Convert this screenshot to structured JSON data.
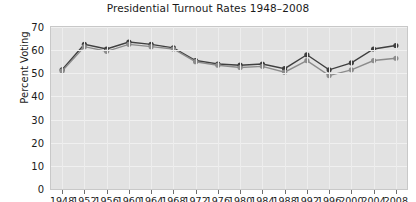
{
  "chart_data": {
    "type": "line",
    "title": "Presidential Turnout Rates 1948–2008",
    "xlabel": "",
    "ylabel": "Percent Voting",
    "ylim": [
      0,
      70
    ],
    "yticks": [
      0,
      10,
      20,
      30,
      40,
      50,
      60,
      70
    ],
    "grid": true,
    "legend": "none",
    "categories": [
      1948,
      1952,
      1956,
      1960,
      1964,
      1968,
      1972,
      1976,
      1980,
      1984,
      1988,
      1992,
      1996,
      2000,
      2004,
      2008
    ],
    "x": [
      "1948",
      "1952",
      "1956",
      "1960",
      "1964",
      "1968",
      "1972",
      "1976",
      "1980",
      "1984",
      "1988",
      "1992",
      "1996",
      "2000",
      "2004",
      "2008"
    ],
    "series": [
      {
        "name": "VEP turnout",
        "color": "#3f3f3f",
        "marker": "circle",
        "values": [
          51.5,
          62.5,
          60.5,
          63.5,
          62.5,
          61.0,
          55.5,
          54.0,
          53.5,
          54.0,
          52.0,
          58.0,
          51.5,
          54.5,
          60.5,
          62.0
        ]
      },
      {
        "name": "VAP turnout",
        "color": "#8c8c8c",
        "marker": "circle",
        "values": [
          51.0,
          61.5,
          59.5,
          62.5,
          61.5,
          60.5,
          55.0,
          53.5,
          52.5,
          53.0,
          50.5,
          55.5,
          49.0,
          51.5,
          55.5,
          56.5
        ]
      }
    ]
  }
}
